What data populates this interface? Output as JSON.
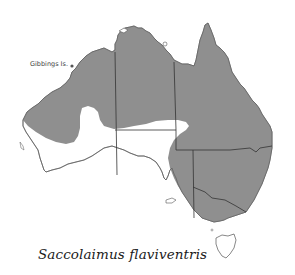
{
  "map": {
    "title": "Saccolaimus flaviventris",
    "region": "Australia",
    "range_fill_color": "#8f8f8f",
    "outline_color": "#555555",
    "background_color": "#ffffff",
    "labels": [
      {
        "text": "Gibbings Is.",
        "marker": "dot-marker"
      }
    ]
  }
}
